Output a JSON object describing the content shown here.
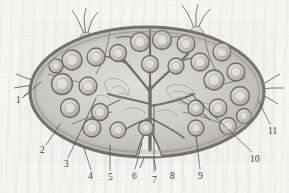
{
  "figure": {
    "kind": "anatomical-illustration",
    "style": "grayscale scanned line-and-wash drawing",
    "background_color": "#f7f6f3",
    "ink_color": "#4a4a4c",
    "capsule_color": "#6e6b68",
    "parenchyma_color": "#cfcdc8",
    "follicle_color": "#bdbab5",
    "width": 289,
    "height": 193
  },
  "labels": [
    {
      "id": "1",
      "text": "1",
      "x": 16,
      "y": 96,
      "leader_from": [
        24,
        96
      ],
      "leader_to": [
        41,
        82
      ]
    },
    {
      "id": "2",
      "text": "2",
      "x": 40,
      "y": 146,
      "leader_from": [
        46,
        145
      ],
      "leader_to": [
        60,
        124
      ]
    },
    {
      "id": "3",
      "text": "3",
      "x": 64,
      "y": 160,
      "leader_from": [
        68,
        158
      ],
      "leader_to": [
        96,
        98
      ]
    },
    {
      "id": "4",
      "text": "4",
      "x": 88,
      "y": 172,
      "leader_from": [
        91,
        170
      ],
      "leader_to": [
        84,
        148
      ]
    },
    {
      "id": "5",
      "text": "5",
      "x": 108,
      "y": 173,
      "leader_from": [
        110,
        170
      ],
      "leader_to": [
        110,
        145
      ]
    },
    {
      "id": "6",
      "text": "6",
      "x": 132,
      "y": 172,
      "leader_from": [
        135,
        169
      ],
      "leader_to": [
        142,
        143
      ]
    },
    {
      "id": "7",
      "text": "7",
      "x": 152,
      "y": 176,
      "leader_from": [
        154,
        172
      ],
      "leader_to": [
        154,
        105
      ]
    },
    {
      "id": "8",
      "text": "8",
      "x": 170,
      "y": 172,
      "leader_from": null,
      "leader_to": null
    },
    {
      "id": "9",
      "text": "9",
      "x": 198,
      "y": 172,
      "leader_from": [
        200,
        169
      ],
      "leader_to": [
        196,
        136
      ]
    },
    {
      "id": "10",
      "text": "10",
      "x": 250,
      "y": 155,
      "leader_from": [
        252,
        152
      ],
      "leader_to": [
        190,
        93
      ]
    },
    {
      "id": "11",
      "text": "11",
      "x": 268,
      "y": 127,
      "leader_from": [
        270,
        124
      ],
      "leader_to": [
        258,
        100
      ]
    }
  ],
  "structures": {
    "capsule": "outer dark elliptical capsule",
    "cortex": "peripheral region containing lymphoid follicles",
    "follicles": "rounded nodules with pale germinal centres around the periphery",
    "trabeculae": "branching connective-tissue strands radiating inward",
    "hilum": "notch at lower centre where vessels enter and leave",
    "afferent_vessels": "valved lymphatic vessels entering at top and left",
    "efferent_vessel": "valved lymphatic vessel leaving at right and at hilum"
  },
  "follicle_positions": [
    [
      72,
      60
    ],
    [
      96,
      57
    ],
    [
      62,
      84
    ],
    [
      88,
      86
    ],
    [
      70,
      108
    ],
    [
      100,
      112
    ],
    [
      118,
      53
    ],
    [
      140,
      42
    ],
    [
      162,
      40
    ],
    [
      186,
      44
    ],
    [
      150,
      64
    ],
    [
      176,
      66
    ],
    [
      200,
      62
    ],
    [
      222,
      52
    ],
    [
      214,
      80
    ],
    [
      236,
      72
    ],
    [
      240,
      96
    ],
    [
      218,
      108
    ],
    [
      196,
      108
    ],
    [
      92,
      128
    ],
    [
      118,
      130
    ],
    [
      146,
      128
    ],
    [
      196,
      128
    ],
    [
      228,
      126
    ],
    [
      56,
      66
    ],
    [
      244,
      116
    ]
  ]
}
